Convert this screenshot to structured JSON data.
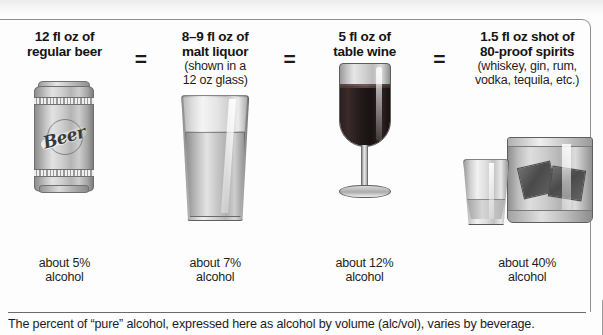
{
  "infographic": {
    "title_note": "The percent of “pure” alcohol, expressed here as alcohol by volume (alc/vol), varies by beverage.",
    "equals_symbol": "=",
    "columns": [
      {
        "id": "regular-beer",
        "heading_line1": "12 fl oz of",
        "heading_line2": "regular beer",
        "sub_line1": "",
        "sub_line2": "",
        "percent_line1": "about 5%",
        "percent_line2": "alcohol",
        "abv": 5,
        "volume_fl_oz": "12",
        "icon": "beer-can-icon",
        "can_label": "Beer"
      },
      {
        "id": "malt-liquor",
        "heading_line1": "8–9 fl oz of",
        "heading_line2": "malt liquor",
        "sub_line1": "(shown in a",
        "sub_line2": "12 oz glass)",
        "percent_line1": "about 7%",
        "percent_line2": "alcohol",
        "abv": 7,
        "volume_fl_oz": "8–9",
        "icon": "pint-glass-icon"
      },
      {
        "id": "table-wine",
        "heading_line1": "5 fl oz of",
        "heading_line2": "table wine",
        "sub_line1": "",
        "sub_line2": "",
        "percent_line1": "about 12%",
        "percent_line2": "alcohol",
        "abv": 12,
        "volume_fl_oz": "5",
        "icon": "wine-glass-icon"
      },
      {
        "id": "spirits",
        "heading_line1": "1.5 fl oz shot of",
        "heading_line2": "80-proof spirits",
        "sub_line1": "(whiskey, gin, rum,",
        "sub_line2": "vodka, tequila, etc.)",
        "percent_line1": "about 40%",
        "percent_line2": "alcohol",
        "abv": 40,
        "volume_fl_oz": "1.5",
        "icon": "shot-glass-icon"
      }
    ],
    "colors": {
      "text": "#1c1c1c",
      "border": "#8d8d8d",
      "rule": "#6b6b6b",
      "wine_fill": "#241b1b"
    }
  }
}
